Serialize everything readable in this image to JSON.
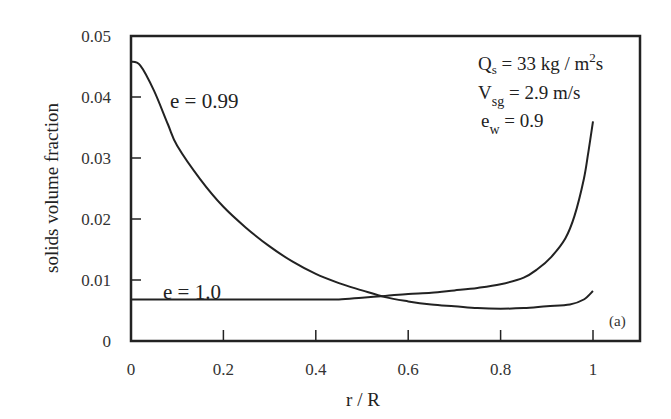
{
  "chart_data": {
    "type": "line",
    "title": "",
    "xlabel": "r / R",
    "ylabel": "solids volume fraction",
    "xlim": [
      0,
      1.05
    ],
    "ylim": [
      0,
      0.05
    ],
    "x_ticks": [
      "0",
      "0.2",
      "0.4",
      "0.6",
      "0.8",
      "1"
    ],
    "y_ticks": [
      "0",
      "0.01",
      "0.02",
      "0.03",
      "0.04",
      "0.05"
    ],
    "grid": false,
    "legend": "none (inline curve labels)",
    "panel_label": "(a)",
    "annotations": {
      "Qs": "Q",
      "Qs_sub": "s",
      "Qs_rest": " = 33 kg /  m",
      "Qs_sup": "2",
      "Qs_unit_tail": "s",
      "Vsg": "V",
      "Vsg_sub": "sg",
      "Vsg_rest": " = 2.9 m/s",
      "ew": "e",
      "ew_sub": "w",
      "ew_rest": " = 0.9"
    },
    "series": [
      {
        "name": "e = 0.99",
        "x": [
          0,
          0.02,
          0.05,
          0.08,
          0.1,
          0.15,
          0.2,
          0.25,
          0.3,
          0.35,
          0.4,
          0.45,
          0.5,
          0.55,
          0.6,
          0.65,
          0.7,
          0.75,
          0.8,
          0.85,
          0.9,
          0.95,
          0.98,
          1.0
        ],
        "values": [
          0.0458,
          0.0452,
          0.041,
          0.0355,
          0.032,
          0.0265,
          0.022,
          0.0185,
          0.0155,
          0.013,
          0.011,
          0.0095,
          0.0083,
          0.0072,
          0.0065,
          0.006,
          0.0057,
          0.0054,
          0.0053,
          0.0054,
          0.0057,
          0.006,
          0.0068,
          0.0082
        ]
      },
      {
        "name": "e = 1.0",
        "x": [
          0,
          0.1,
          0.2,
          0.3,
          0.4,
          0.45,
          0.5,
          0.55,
          0.6,
          0.65,
          0.7,
          0.75,
          0.8,
          0.85,
          0.88,
          0.91,
          0.94,
          0.96,
          0.98,
          0.99,
          1.0
        ],
        "values": [
          0.0068,
          0.0068,
          0.0068,
          0.0068,
          0.0068,
          0.0068,
          0.0071,
          0.0074,
          0.0077,
          0.0079,
          0.0083,
          0.0087,
          0.0093,
          0.0104,
          0.0118,
          0.0138,
          0.0168,
          0.0205,
          0.0265,
          0.031,
          0.036
        ]
      }
    ]
  }
}
